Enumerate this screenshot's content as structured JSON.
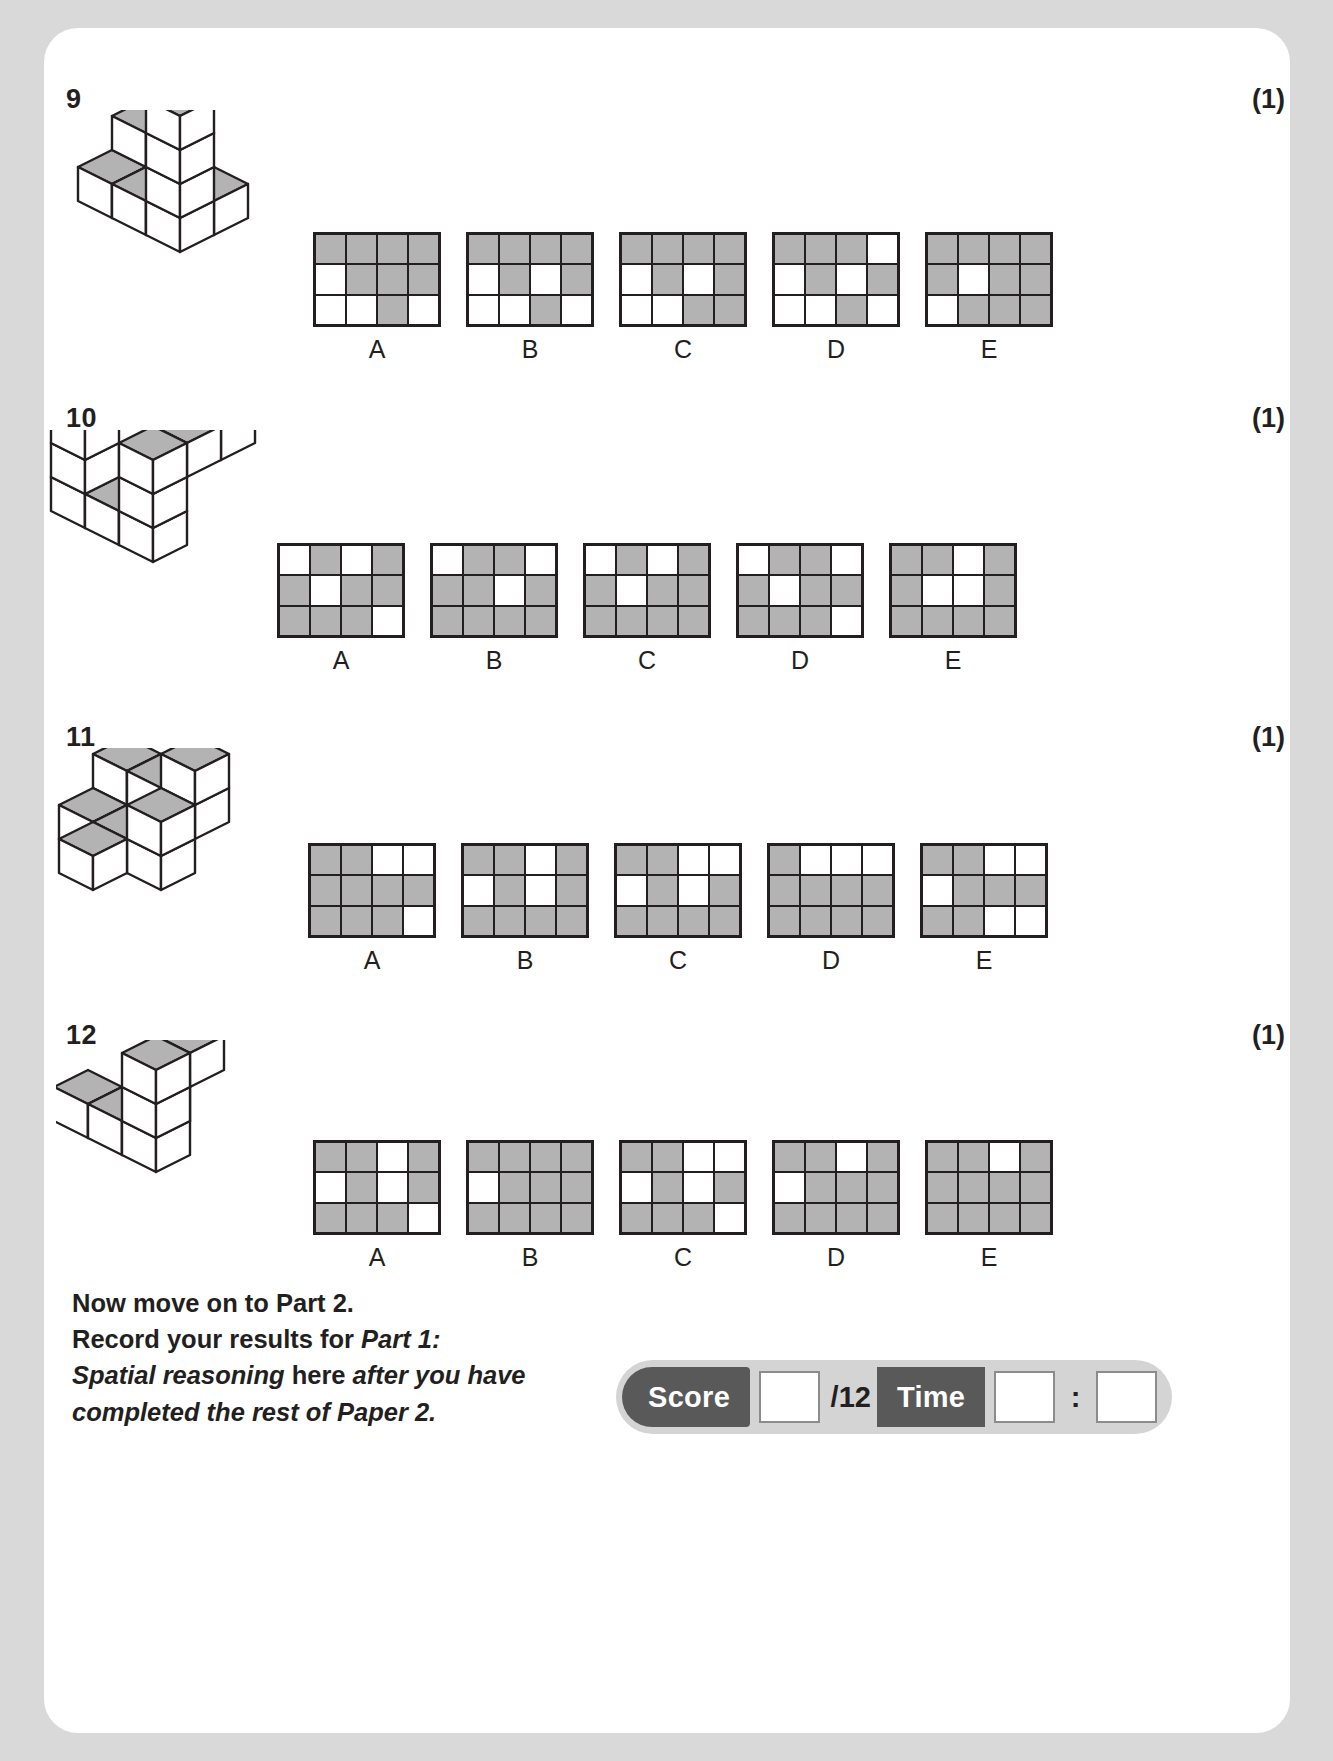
{
  "page": {
    "background_color": "#d9d9d9",
    "sheet_color": "#ffffff",
    "fill_color": "#b3b3b3",
    "line_color": "#231f20"
  },
  "questions": [
    {
      "number": "9",
      "mark": "(1)",
      "options": [
        {
          "label": "A",
          "cells": [
            [
              1,
              1,
              1,
              1
            ],
            [
              0,
              1,
              1,
              1
            ],
            [
              0,
              0,
              1,
              0
            ]
          ]
        },
        {
          "label": "B",
          "cells": [
            [
              1,
              1,
              1,
              1
            ],
            [
              0,
              1,
              0,
              1
            ],
            [
              0,
              0,
              1,
              0
            ]
          ]
        },
        {
          "label": "C",
          "cells": [
            [
              1,
              1,
              1,
              1
            ],
            [
              0,
              1,
              0,
              1
            ],
            [
              0,
              0,
              1,
              1
            ]
          ]
        },
        {
          "label": "D",
          "cells": [
            [
              1,
              1,
              1,
              0
            ],
            [
              0,
              1,
              0,
              1
            ],
            [
              0,
              0,
              1,
              0
            ]
          ]
        },
        {
          "label": "E",
          "cells": [
            [
              1,
              1,
              1,
              1
            ],
            [
              1,
              0,
              1,
              1
            ],
            [
              0,
              1,
              1,
              1
            ]
          ]
        }
      ]
    },
    {
      "number": "10",
      "mark": "(1)",
      "options": [
        {
          "label": "A",
          "cells": [
            [
              0,
              1,
              0,
              1
            ],
            [
              1,
              0,
              1,
              1
            ],
            [
              1,
              1,
              1,
              0
            ]
          ]
        },
        {
          "label": "B",
          "cells": [
            [
              0,
              1,
              1,
              0
            ],
            [
              1,
              1,
              0,
              1
            ],
            [
              1,
              1,
              1,
              1
            ]
          ]
        },
        {
          "label": "C",
          "cells": [
            [
              0,
              1,
              0,
              1
            ],
            [
              1,
              0,
              1,
              1
            ],
            [
              1,
              1,
              1,
              1
            ]
          ]
        },
        {
          "label": "D",
          "cells": [
            [
              0,
              1,
              1,
              0
            ],
            [
              1,
              0,
              1,
              1
            ],
            [
              1,
              1,
              1,
              0
            ]
          ]
        },
        {
          "label": "E",
          "cells": [
            [
              1,
              1,
              0,
              1
            ],
            [
              1,
              0,
              0,
              1
            ],
            [
              1,
              1,
              1,
              1
            ]
          ]
        }
      ]
    },
    {
      "number": "11",
      "mark": "(1)",
      "options": [
        {
          "label": "A",
          "cells": [
            [
              1,
              1,
              0,
              0
            ],
            [
              1,
              1,
              1,
              1
            ],
            [
              1,
              1,
              1,
              0
            ]
          ]
        },
        {
          "label": "B",
          "cells": [
            [
              1,
              1,
              0,
              1
            ],
            [
              0,
              1,
              0,
              1
            ],
            [
              1,
              1,
              1,
              1
            ]
          ]
        },
        {
          "label": "C",
          "cells": [
            [
              1,
              1,
              0,
              0
            ],
            [
              0,
              1,
              0,
              1
            ],
            [
              1,
              1,
              1,
              1
            ]
          ]
        },
        {
          "label": "D",
          "cells": [
            [
              1,
              0,
              0,
              0
            ],
            [
              1,
              1,
              1,
              1
            ],
            [
              1,
              1,
              1,
              1
            ]
          ]
        },
        {
          "label": "E",
          "cells": [
            [
              1,
              1,
              0,
              0
            ],
            [
              0,
              1,
              1,
              1
            ],
            [
              1,
              1,
              0,
              0
            ]
          ]
        }
      ]
    },
    {
      "number": "12",
      "mark": "(1)",
      "options": [
        {
          "label": "A",
          "cells": [
            [
              1,
              1,
              0,
              1
            ],
            [
              0,
              1,
              0,
              1
            ],
            [
              1,
              1,
              1,
              0
            ]
          ]
        },
        {
          "label": "B",
          "cells": [
            [
              1,
              1,
              1,
              1
            ],
            [
              0,
              1,
              1,
              1
            ],
            [
              1,
              1,
              1,
              1
            ]
          ]
        },
        {
          "label": "C",
          "cells": [
            [
              1,
              1,
              0,
              0
            ],
            [
              0,
              1,
              0,
              1
            ],
            [
              1,
              1,
              1,
              0
            ]
          ]
        },
        {
          "label": "D",
          "cells": [
            [
              1,
              1,
              0,
              1
            ],
            [
              0,
              1,
              1,
              1
            ],
            [
              1,
              1,
              1,
              1
            ]
          ]
        },
        {
          "label": "E",
          "cells": [
            [
              1,
              1,
              0,
              1
            ],
            [
              1,
              1,
              1,
              1
            ],
            [
              1,
              1,
              1,
              1
            ]
          ]
        }
      ]
    }
  ],
  "footer": {
    "line1": "Now move on to Part 2.",
    "line2_a": "Record your results for ",
    "line2_b": "Part 1:",
    "line3_a": "Spatial reasoning",
    "line3_b": " here ",
    "line3_c": "after you have",
    "line4": "completed the rest of Paper 2."
  },
  "score_box": {
    "score_label": "Score",
    "total_label": "/12",
    "time_label": "Time",
    "separator": ":",
    "score_value": "",
    "time_minutes": "",
    "time_seconds": ""
  }
}
